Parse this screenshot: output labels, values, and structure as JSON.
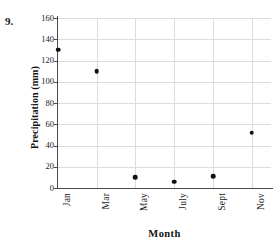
{
  "problem": {
    "number": "9.",
    "header_fragment": ""
  },
  "chart_data": {
    "type": "scatter",
    "title": "",
    "xlabel": "Month",
    "ylabel": "Precipitation (mm)",
    "categories": [
      "Jan",
      "Mar",
      "May",
      "July",
      "Sept",
      "Nov"
    ],
    "values": [
      130,
      110,
      10,
      6,
      11,
      52
    ],
    "points": [
      {
        "x": "Jan",
        "y": 130
      },
      {
        "x": "Mar",
        "y": 110
      },
      {
        "x": "May",
        "y": 10
      },
      {
        "x": "July",
        "y": 6
      },
      {
        "x": "Sept",
        "y": 11
      },
      {
        "x": "Nov",
        "y": 52
      }
    ],
    "ylim": [
      0,
      160
    ],
    "ytick_labels": [
      "0",
      "20",
      "40",
      "60",
      "80",
      "100",
      "120",
      "140",
      "160"
    ],
    "ytick_values": [
      0,
      20,
      40,
      60,
      80,
      100,
      120,
      140,
      160
    ],
    "xtick_labels": [
      "Jan",
      "Mar",
      "May",
      "July",
      "Sept",
      "Nov"
    ],
    "grid": true,
    "legend": "none",
    "marker_color": "#111111",
    "grid_color": "#dcdcdc",
    "axis_color": "#4a4a4a"
  }
}
